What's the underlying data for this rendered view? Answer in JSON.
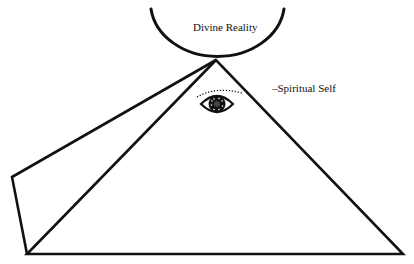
{
  "diagram": {
    "labels": {
      "divine_reality": "Divine Reality",
      "spiritual_self": "–Spiritual Self"
    },
    "icons": {
      "eye": "eye-icon"
    },
    "colors": {
      "stroke": "#111111",
      "background": "#ffffff"
    }
  }
}
